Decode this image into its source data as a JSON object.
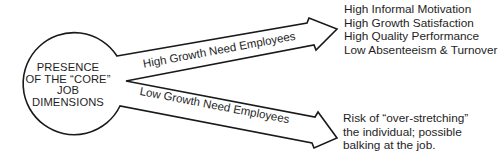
{
  "diagram": {
    "source_node": {
      "lines": [
        "PRESENCE",
        "OF THE “CORE”",
        "JOB",
        "DIMENSIONS"
      ]
    },
    "branches": [
      {
        "label": "High Growth Need Employees",
        "outcomes": [
          "High Informal Motivation",
          "High Growth Satisfaction",
          "High Quality Performance",
          "Low Absenteeism & Turnover"
        ]
      },
      {
        "label": "Low Growth Need Employees",
        "outcomes": [
          "Risk of “over-stretching”",
          "the individual; possible",
          "balking at the job."
        ]
      }
    ],
    "colors": {
      "stroke": "#1a1a1a",
      "fill": "#ffffff",
      "text": "#1e1e1e"
    }
  }
}
